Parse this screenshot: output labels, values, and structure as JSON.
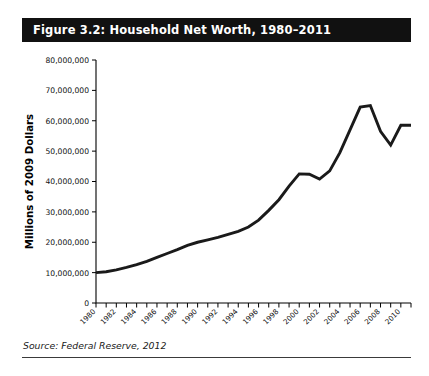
{
  "figure": {
    "title": "Figure 3.2: Household Net Worth, 1980–2011",
    "source_note": "Source: Federal Reserve, 2012",
    "title_bar_color": "#111111",
    "title_text_color": "#ffffff",
    "line_color": "#1a1a1a"
  },
  "chart_data": {
    "type": "line",
    "title": "Figure 3.2: Household Net Worth, 1980–2011",
    "xlabel": "",
    "ylabel": "Millions of 2009 Dollars",
    "xlim": [
      1980,
      2011
    ],
    "ylim": [
      0,
      80000000
    ],
    "grid": false,
    "legend": "none",
    "ytick_labels": [
      "0",
      "10,000,000",
      "20,000,000",
      "30,000,000",
      "40,000,000",
      "50,000,000",
      "60,000,000",
      "70,000,000",
      "80,000,000"
    ],
    "ytick_values": [
      0,
      10000000,
      20000000,
      30000000,
      40000000,
      50000000,
      60000000,
      70000000,
      80000000
    ],
    "xtick_labels": [
      "1980",
      "1982",
      "1984",
      "1986",
      "1988",
      "1990",
      "1992",
      "1994",
      "1996",
      "1998",
      "2000",
      "2002",
      "2004",
      "2006",
      "2008",
      "2010"
    ],
    "xtick_values": [
      1980,
      1982,
      1984,
      1986,
      1988,
      1990,
      1992,
      1994,
      1996,
      1998,
      2000,
      2002,
      2004,
      2006,
      2008,
      2010
    ],
    "x": [
      1980,
      1981,
      1982,
      1983,
      1984,
      1985,
      1986,
      1987,
      1988,
      1989,
      1990,
      1991,
      1992,
      1993,
      1994,
      1995,
      1996,
      1997,
      1998,
      1999,
      2000,
      2001,
      2002,
      2003,
      2004,
      2005,
      2006,
      2007,
      2008,
      2009,
      2010,
      2011
    ],
    "values": [
      10000000,
      10300000,
      10900000,
      11700000,
      12600000,
      13700000,
      15000000,
      16300000,
      17600000,
      19000000,
      20000000,
      20800000,
      21600000,
      22600000,
      23600000,
      25000000,
      27300000,
      30500000,
      34000000,
      38500000,
      42500000,
      42400000,
      40800000,
      43500000,
      49500000,
      57000000,
      64500000,
      65000000,
      56500000,
      52000000,
      58500000,
      58500000
    ],
    "series_name": "Household Net Worth"
  }
}
